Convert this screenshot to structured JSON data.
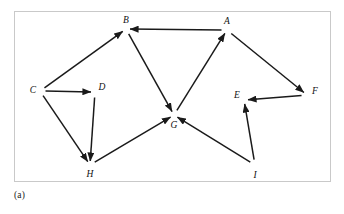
{
  "figure": {
    "caption": "(a)",
    "frame_color": "#c9c9c9",
    "background_color": "#ffffff",
    "edge_color": "#1a1a1a",
    "label_color": "#111111"
  },
  "graph": {
    "type": "directed-graph",
    "node_count": 9,
    "edge_count": 12,
    "nodes": [
      {
        "id": "A",
        "label": "A",
        "x": 212,
        "y": 18,
        "lx": 212,
        "ly": 10
      },
      {
        "id": "B",
        "label": "B",
        "x": 111,
        "y": 17,
        "lx": 111,
        "ly": 9
      },
      {
        "id": "C",
        "label": "C",
        "x": 25,
        "y": 79,
        "lx": 18,
        "ly": 79
      },
      {
        "id": "D",
        "label": "D",
        "x": 80,
        "y": 80,
        "lx": 87,
        "ly": 76
      },
      {
        "id": "E",
        "label": "E",
        "x": 229,
        "y": 88,
        "lx": 222,
        "ly": 84
      },
      {
        "id": "F",
        "label": "F",
        "x": 292,
        "y": 83,
        "lx": 300,
        "ly": 80
      },
      {
        "id": "G",
        "label": "G",
        "x": 159,
        "y": 103,
        "lx": 159,
        "ly": 114
      },
      {
        "id": "H",
        "label": "H",
        "x": 75,
        "y": 153,
        "lx": 75,
        "ly": 163
      },
      {
        "id": "I",
        "label": "I",
        "x": 240,
        "y": 153,
        "lx": 240,
        "ly": 164
      }
    ],
    "edges": [
      {
        "from": "A",
        "to": "B",
        "label": "A-to-B"
      },
      {
        "from": "C",
        "to": "B",
        "label": "C-to-B"
      },
      {
        "from": "B",
        "to": "G",
        "label": "B-to-G"
      },
      {
        "from": "C",
        "to": "D",
        "label": "C-to-D"
      },
      {
        "from": "C",
        "to": "H",
        "label": "C-to-H"
      },
      {
        "from": "D",
        "to": "H",
        "label": "D-to-H"
      },
      {
        "from": "H",
        "to": "G",
        "label": "H-to-G"
      },
      {
        "from": "G",
        "to": "A",
        "label": "G-to-A"
      },
      {
        "from": "A",
        "to": "F",
        "label": "A-to-F"
      },
      {
        "from": "F",
        "to": "E",
        "label": "F-to-E"
      },
      {
        "from": "I",
        "to": "E",
        "label": "I-to-E"
      },
      {
        "from": "I",
        "to": "G",
        "label": "I-to-G"
      }
    ]
  }
}
